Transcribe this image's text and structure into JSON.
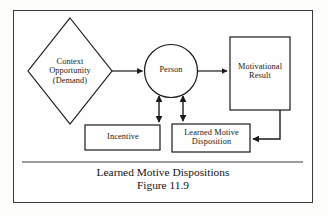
{
  "figure": {
    "caption_title": "Learned Motive Dispositions",
    "caption_number": "Figure 11.9",
    "border_color": "#3a3a3a",
    "stroke_color": "#1a1a1a",
    "background_color": "#fefefe"
  },
  "nodes": {
    "context": {
      "label": "Context\nOpportunity\n(Demand)",
      "shape": "diamond"
    },
    "person": {
      "label": "Person",
      "shape": "circle"
    },
    "motivational_result": {
      "label": "Motivational\nResult",
      "shape": "rectangle"
    },
    "incentive": {
      "label": "Incentive",
      "shape": "rectangle"
    },
    "learned_motive_disposition": {
      "label": "Learned Motive\nDisposition",
      "shape": "rectangle"
    }
  },
  "connectors": [
    {
      "name": "context-to-person",
      "from": "context",
      "to": "person",
      "arrow": "single"
    },
    {
      "name": "person-to-motivational-result",
      "from": "person",
      "to": "motivational_result",
      "arrow": "single"
    },
    {
      "name": "person-incentive-link",
      "from": "person",
      "to": "incentive",
      "arrow": "double"
    },
    {
      "name": "person-lmd-link",
      "from": "person",
      "to": "learned_motive_disposition",
      "arrow": "double"
    },
    {
      "name": "motivational-result-feedback",
      "from": "motivational_result",
      "to": "learned_motive_disposition",
      "arrow": "single"
    }
  ]
}
